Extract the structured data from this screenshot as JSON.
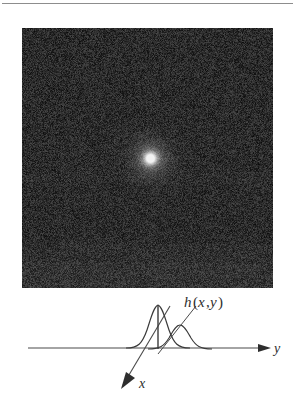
{
  "figure": {
    "kind": "point-spread-function-illustration",
    "top_rule": {
      "visible": true,
      "color": "#8d8d8d"
    }
  },
  "noise_image": {
    "label": "noisy-dark-field-image",
    "base_color": "#2b2b2b",
    "grain_color_dark": "#141414",
    "grain_color_light": "#565656",
    "band_color": "#343434",
    "bright_spot": {
      "name": "point-spread-function-spot",
      "center_x_pct": 51,
      "center_y_pct": 50,
      "radius_px": 11,
      "core_color": "#f2f2f2",
      "halo_color": "#6a6a6a"
    },
    "streak": {
      "name": "horizontal-streak",
      "color": "#3c3c3c"
    }
  },
  "diagram": {
    "name": "axes-and-psf-profile",
    "axis_color": "#4a4a4a",
    "curve_color": "#3a3a3a",
    "labels": {
      "function": "h(x,y)",
      "function_h": "h",
      "function_paren_open": "(",
      "function_x": "x",
      "function_comma": ",",
      "function_y": "y",
      "function_paren_close": ")",
      "axis_y": "y",
      "axis_x": "x"
    },
    "axes": [
      {
        "name": "y-axis",
        "label": "y",
        "direction": "right"
      },
      {
        "name": "x-axis",
        "label": "x",
        "direction": "down-left"
      }
    ],
    "curves": [
      {
        "name": "narrow-gaussian",
        "role": "tall-narrow-profile"
      },
      {
        "name": "wide-gaussian",
        "role": "broader-offset-profile"
      }
    ]
  },
  "chart_data": {
    "type": "line",
    "xlabel": "y",
    "ylabel": "",
    "grid": false,
    "legend": "none",
    "annotations": [
      "h(x,y)",
      "x",
      "y"
    ],
    "series": [
      {
        "name": "narrow-gaussian",
        "x": [
          0,
          4,
          8,
          12,
          16,
          20,
          24,
          28,
          32,
          36,
          40,
          44,
          48,
          52,
          56,
          60,
          64,
          68,
          72
        ],
        "values": [
          0,
          0.4,
          1.0,
          2.2,
          4.5,
          9.0,
          18.0,
          34.0,
          58.0,
          78.0,
          58.0,
          34.0,
          18.0,
          9.0,
          4.5,
          2.2,
          1.0,
          0.4,
          0
        ]
      },
      {
        "name": "wide-gaussian",
        "x": [
          8,
          14,
          20,
          26,
          32,
          38,
          44,
          50,
          56,
          62,
          68,
          74,
          80,
          86,
          92
        ],
        "values": [
          0,
          1.0,
          2.5,
          5.5,
          11.0,
          19.0,
          28.0,
          34.0,
          28.0,
          19.0,
          11.0,
          5.5,
          2.5,
          1.0,
          0
        ]
      }
    ],
    "xlim": [
      0,
      92
    ],
    "ylim": [
      0,
      80
    ]
  }
}
